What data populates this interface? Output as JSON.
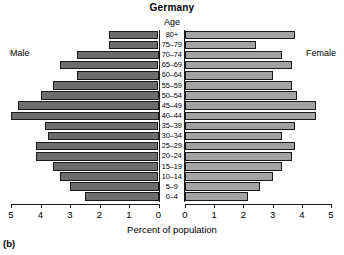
{
  "chart_data": {
    "type": "bar",
    "subtype": "population-pyramid",
    "title": "Germany",
    "panel_tag": "(b)",
    "xlabel": "Percent of population",
    "ylabel": "Age",
    "axis_header": "Age",
    "left_series_label": "Male",
    "right_series_label": "Female",
    "xlim": [
      0,
      5
    ],
    "xticks": [
      0,
      1,
      2,
      3,
      4,
      5
    ],
    "xtick_labels_left": [
      "5",
      "4",
      "3",
      "2",
      "1",
      "0"
    ],
    "xtick_labels_right": [
      "0",
      "1",
      "2",
      "3",
      "4",
      "5"
    ],
    "grid": false,
    "legend_position": "inline-sides",
    "categories": [
      "80+",
      "75-79",
      "70-74",
      "65-69",
      "60-64",
      "55-59",
      "50-54",
      "45-49",
      "40-44",
      "35-39",
      "30-34",
      "25-29",
      "20-24",
      "15-19",
      "10-14",
      "5-9",
      "0-4"
    ],
    "series": [
      {
        "name": "Male",
        "color": "#6d6d6d",
        "direction": "left",
        "values": [
          2.0,
          2.0,
          3.3,
          4.0,
          3.3,
          4.3,
          4.8,
          5.7,
          6.0,
          4.6,
          4.5,
          5.0,
          5.0,
          4.3,
          4.0,
          3.6,
          3.0
        ]
      },
      {
        "name": "Female",
        "color": "#a3a3a3",
        "direction": "right",
        "values": [
          4.5,
          2.9,
          4.0,
          4.4,
          3.6,
          4.4,
          4.6,
          5.4,
          5.4,
          4.5,
          4.0,
          4.5,
          4.4,
          4.0,
          3.6,
          3.1,
          2.6
        ]
      }
    ]
  },
  "scale": {
    "unit_percent_per_tick": 1,
    "note_units": "percent"
  }
}
